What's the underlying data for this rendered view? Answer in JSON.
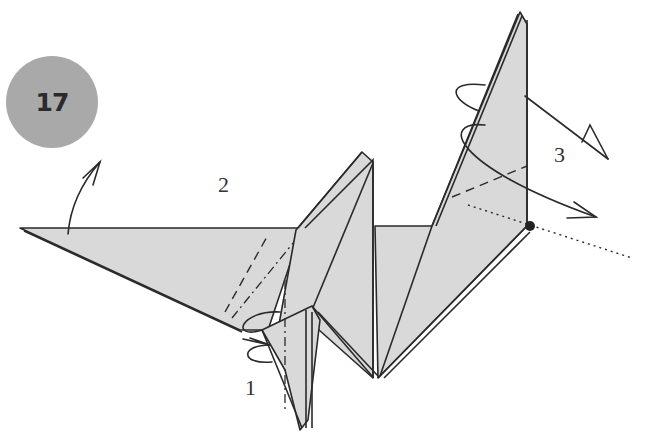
{
  "step": {
    "number": "17",
    "badge_color": "#a9a9a9"
  },
  "labels": {
    "substep_1": "1",
    "substep_2": "2",
    "substep_3": "3"
  },
  "colors": {
    "paper_fill": "#d9d9d9",
    "line": "#2a2a2a",
    "background": "#ffffff"
  },
  "symbols": [
    "valley-fold-arrow",
    "mountain-fold-line",
    "valley-fold-line",
    "inside-reverse-fold-arrow",
    "pivot-point-dot",
    "x-ray-dotted-line"
  ]
}
